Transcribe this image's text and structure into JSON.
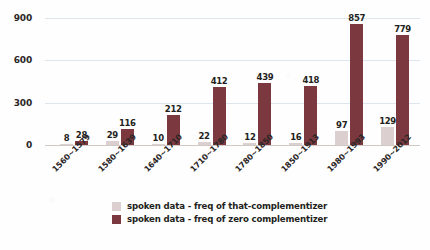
{
  "chart_data": {
    "type": "bar",
    "title": "",
    "xlabel": "",
    "ylabel": "",
    "ylim": [
      0,
      900
    ],
    "yticks": [
      0,
      300,
      600,
      900
    ],
    "grid": true,
    "legend_position": "bottom",
    "categories": [
      "1560~1579",
      "1580~1639",
      "1640~1710",
      "1710~1780",
      "1780~1850",
      "1850~1913",
      "1980~1993",
      "1990~2012"
    ],
    "series": [
      {
        "name": "spoken data - freq of that-complementizer",
        "color": "#dccfcf",
        "values": [
          8,
          29,
          10,
          22,
          12,
          16,
          97,
          129
        ]
      },
      {
        "name": "spoken data - freq of zero complementizer",
        "color": "#7b393f",
        "values": [
          28,
          116,
          212,
          412,
          439,
          418,
          857,
          779
        ]
      }
    ]
  },
  "colors": {
    "series_light": "#dccfcf",
    "series_dark": "#7b393f",
    "gridline": "#dbe6ef",
    "axis": "#cfc9c6",
    "text": "#231f20",
    "background": "#fefefe"
  }
}
